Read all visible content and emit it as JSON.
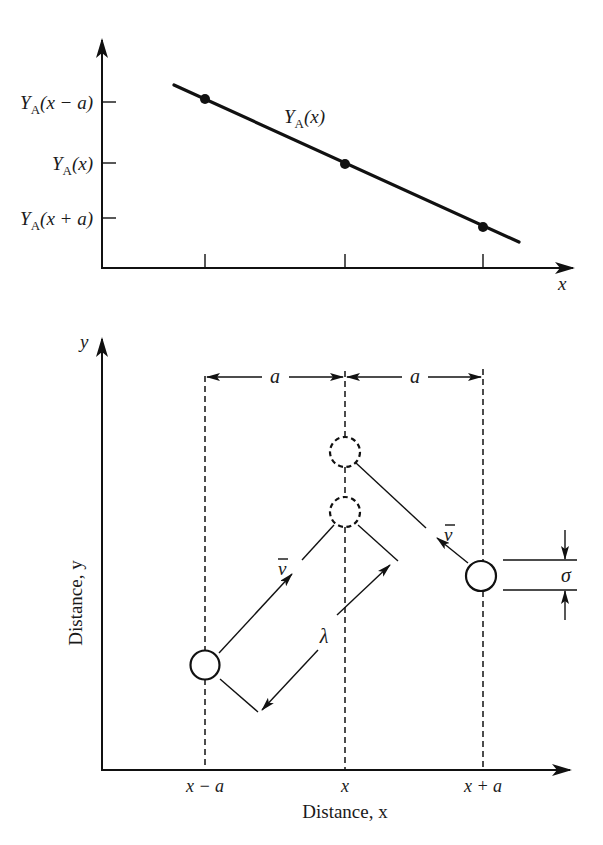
{
  "top_plot": {
    "y_tick_labels": [
      {
        "main": "Y",
        "sub": "A",
        "arg": "(x − a)"
      },
      {
        "main": "Y",
        "sub": "A",
        "arg": "(x)"
      },
      {
        "main": "Y",
        "sub": "A",
        "arg": "(x + a)"
      }
    ],
    "curve_label": {
      "main": "Y",
      "sub": "A",
      "arg": "(x)"
    },
    "x_axis_label": "x",
    "x_tick_positions": [
      "x − a",
      "x",
      "x + a"
    ],
    "points": [
      {
        "x": "x − a",
        "y": "Y_A(x − a)"
      },
      {
        "x": "x",
        "y": "Y_A(x)"
      },
      {
        "x": "x + a",
        "y": "Y_A(x + a)"
      }
    ]
  },
  "bottom_plot": {
    "y_axis_symbol": "y",
    "y_axis_label": "Distance, y",
    "x_axis_label": "Distance, x",
    "x_tick_labels": [
      "x − a",
      "x",
      "x + a"
    ],
    "spacing_labels": [
      "a",
      "a"
    ],
    "velocity_label": "v",
    "free_path_label": "λ",
    "diameter_label": "σ"
  }
}
